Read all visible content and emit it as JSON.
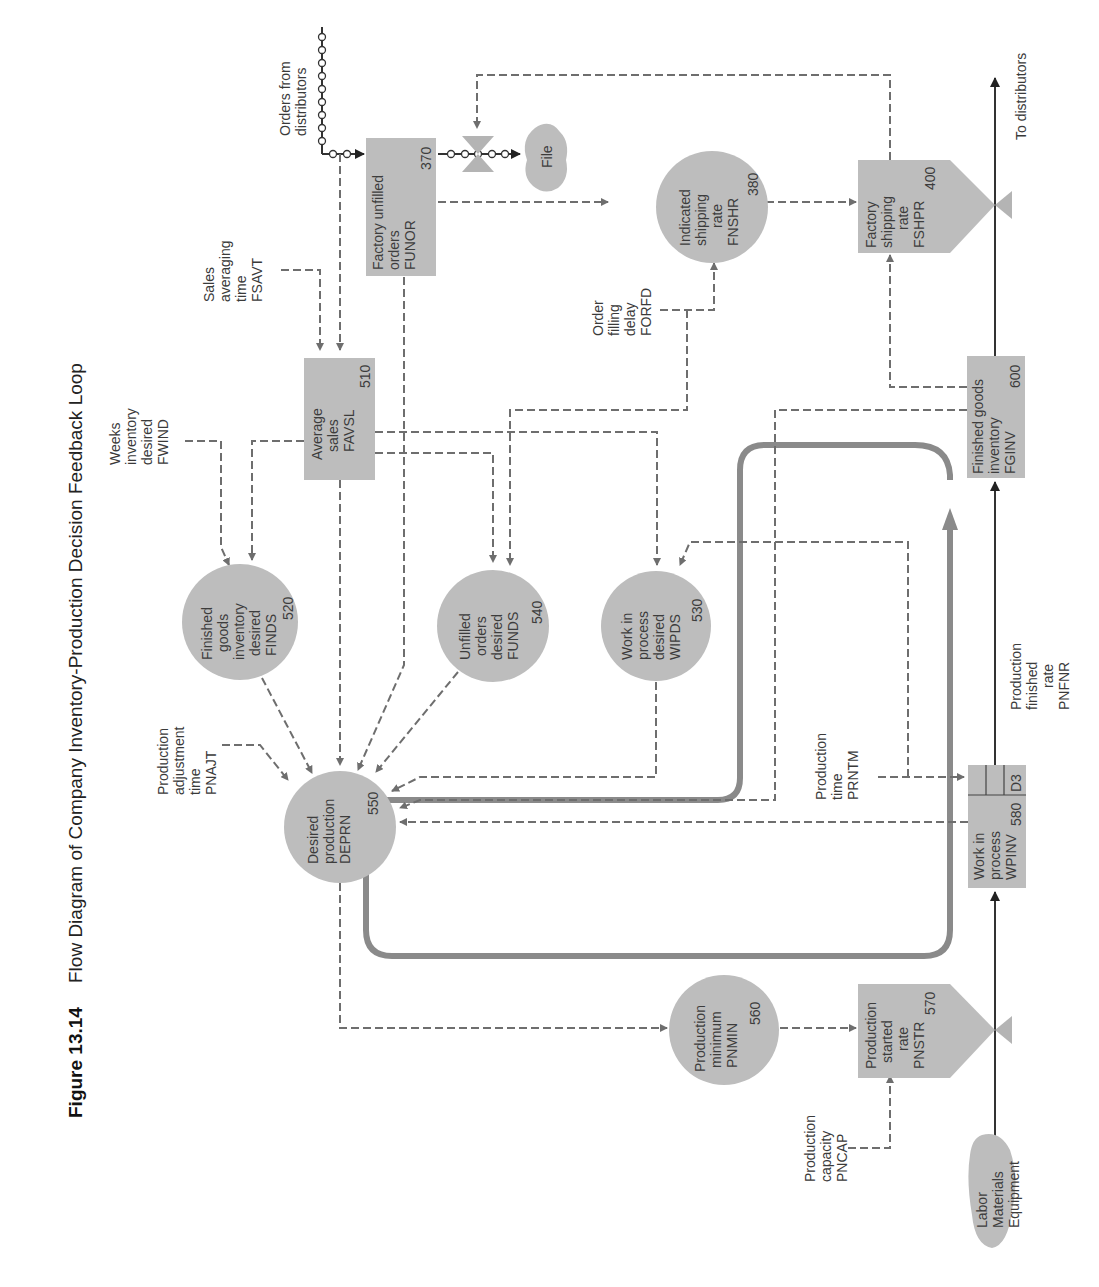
{
  "figure": {
    "number": "Figure 13.14",
    "title": "Flow Diagram of Company Inventory-Production Decision Feedback Loop"
  },
  "nodes": {
    "funor": {
      "shape": "level",
      "lines": [
        "Factory unfilled",
        "orders",
        "FUNOR"
      ],
      "number": "370"
    },
    "fnshr": {
      "shape": "auxiliary",
      "lines": [
        "Indicated",
        "shipping",
        "rate",
        "FNSHR"
      ],
      "number": "380"
    },
    "fshpr": {
      "shape": "rate",
      "lines": [
        "Factory",
        "shipping",
        "rate",
        "FSHPR"
      ],
      "number": "400"
    },
    "favsl": {
      "shape": "level",
      "lines": [
        "Average",
        "sales",
        "FAVSL"
      ],
      "number": "510"
    },
    "finds": {
      "shape": "auxiliary",
      "lines": [
        "Finished",
        "goods",
        "inventory",
        "desired",
        "FINDS"
      ],
      "number": "520"
    },
    "funds": {
      "shape": "auxiliary",
      "lines": [
        "Unfilled",
        "orders",
        "desired",
        "FUNDS"
      ],
      "number": "540"
    },
    "wipds": {
      "shape": "auxiliary",
      "lines": [
        "Work in",
        "process",
        "desired",
        "WIPDS"
      ],
      "number": "530"
    },
    "deprn": {
      "shape": "auxiliary",
      "lines": [
        "Desired",
        "production",
        "DEPRN"
      ],
      "number": "550"
    },
    "pnmin": {
      "shape": "auxiliary",
      "lines": [
        "Production",
        "minimum",
        "PNMIN"
      ],
      "number": "560"
    },
    "pnstr": {
      "shape": "rate",
      "lines": [
        "Production",
        "started",
        "rate",
        "PNSTR"
      ],
      "number": "570"
    },
    "wpinv": {
      "shape": "level",
      "lines": [
        "Work in",
        "process",
        "WPINV"
      ],
      "number": "580",
      "delay": "D3"
    },
    "fginv": {
      "shape": "level",
      "lines": [
        "Finished goods",
        "inventory",
        "FGINV"
      ],
      "number": "600"
    }
  },
  "sources": {
    "file": "File",
    "labor": [
      "Labor",
      "Materials",
      "Equipment"
    ]
  },
  "labels": {
    "orders_from": [
      "Orders from",
      "distributors"
    ],
    "to_distributors": "To distributors",
    "fsavt": [
      "Sales",
      "averaging",
      "time",
      "FSAVT"
    ],
    "fwind": [
      "Weeks",
      "inventory",
      "desired",
      "FWIND"
    ],
    "forfd": [
      "Order",
      "filling",
      "delay",
      "FORFD"
    ],
    "pnajt": [
      "Production",
      "adjustment",
      "time",
      "PNAJT"
    ],
    "prntm": [
      "Production",
      "time",
      "PRNTM"
    ],
    "pnfnr": [
      "Production",
      "finished",
      "rate",
      "PNFNR"
    ],
    "pncap": [
      "Production",
      "capacity",
      "PNCAP"
    ]
  }
}
